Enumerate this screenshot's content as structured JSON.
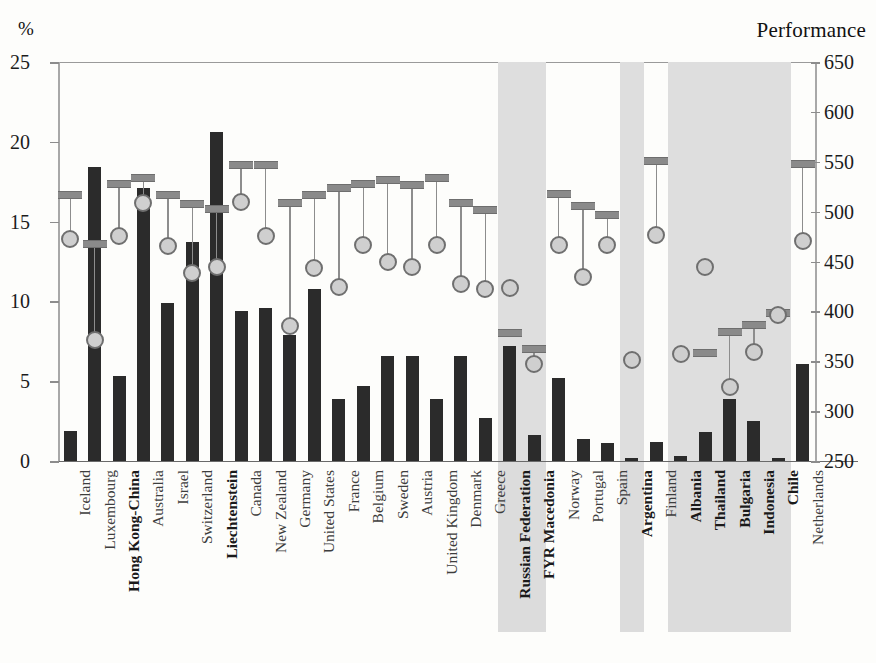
{
  "chart_data": {
    "type": "bar",
    "title": "",
    "ylabel": "%",
    "ylabel_right": "Performance",
    "ylim": [
      0,
      25
    ],
    "ylim_right": [
      250,
      650
    ],
    "yticks": [
      "0",
      "5",
      "10",
      "15",
      "20",
      "25"
    ],
    "yticks_right": [
      "250",
      "300",
      "350",
      "400",
      "450",
      "500",
      "550",
      "600",
      "650"
    ],
    "grid": false,
    "legend_position": "right-outside",
    "legend": [
      {
        "marker": "black-square",
        "name": "Percentage of students (bar, left axis)"
      },
      {
        "marker": "gray-bar",
        "name": "Top performance level (right axis)"
      },
      {
        "marker": "gray-circle",
        "name": "Bottom performance level (right axis)"
      }
    ],
    "categories": [
      "Iceland",
      "Luxembourg",
      "Hong Kong-China",
      "Australia",
      "Israel",
      "Switzerland",
      "Liechtenstein",
      "Canada",
      "New Zealand",
      "Germany",
      "United States",
      "France",
      "Belgium",
      "Sweden",
      "Austria",
      "United Kingdom",
      "Denmark",
      "Greece",
      "Russian Federation",
      "FYR Macedonia",
      "Norway",
      "Portugal",
      "Spain",
      "Argentina",
      "Finland",
      "Albania",
      "Thailand",
      "Bulgaria",
      "Indonesia",
      "Chile",
      "Netherlands"
    ],
    "categories_bold": [
      "Hong Kong-China",
      "Liechtenstein",
      "Russian Federation",
      "FYR Macedonia",
      "Argentina",
      "Albania",
      "Thailand",
      "Bulgaria",
      "Indonesia",
      "Chile"
    ],
    "shaded_categories": [
      "Russian Federation",
      "FYR Macedonia",
      "Argentina",
      "Albania",
      "Thailand",
      "Bulgaria",
      "Indonesia",
      "Chile"
    ],
    "series": [
      {
        "name": "Percentage of students",
        "axis": "left",
        "unit": "%",
        "values": [
          1.9,
          18.4,
          5.3,
          17.1,
          9.9,
          13.7,
          20.6,
          9.4,
          9.6,
          7.9,
          10.8,
          3.9,
          4.7,
          6.6,
          6.6,
          3.9,
          6.6,
          2.7,
          7.2,
          1.6,
          5.2,
          1.4,
          1.1,
          0.2,
          1.2,
          0.3,
          1.8,
          3.9,
          2.5,
          0.2,
          6.1
        ]
      },
      {
        "name": "Top performance level",
        "axis": "right",
        "values": [
          517,
          468,
          528,
          534,
          517,
          508,
          503,
          547,
          547,
          509,
          517,
          524,
          528,
          532,
          527,
          534,
          509,
          502,
          378,
          362,
          518,
          506,
          497,
          null,
          551,
          null,
          358,
          379,
          386,
          398,
          548
        ]
      },
      {
        "name": "Bottom performance level",
        "axis": "right",
        "values": [
          473,
          371,
          476,
          509,
          466,
          438,
          444,
          510,
          476,
          385,
          443,
          424,
          467,
          450,
          444,
          467,
          427,
          422,
          423,
          347,
          467,
          434,
          467,
          351,
          477,
          357,
          444,
          324,
          359,
          396,
          471
        ]
      }
    ]
  }
}
